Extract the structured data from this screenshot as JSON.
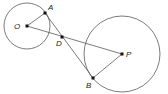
{
  "diagram": {
    "type": "geometry",
    "colors": {
      "stroke": "#5a5a5a",
      "point": "#111111",
      "label": "#222222",
      "background": "#ffffff"
    },
    "circles": [
      {
        "name": "circle-O",
        "center": "O",
        "cx": 27,
        "cy": 26,
        "r": 23
      },
      {
        "name": "circle-P",
        "center": "P",
        "cx": 122,
        "cy": 54,
        "r": 38
      }
    ],
    "points": {
      "O": {
        "label": "O",
        "x": 27,
        "y": 26,
        "lx": 14,
        "ly": 29
      },
      "A": {
        "label": "A",
        "x": 45,
        "y": 13,
        "lx": 48,
        "ly": 10
      },
      "D": {
        "label": "D",
        "x": 62,
        "y": 37,
        "lx": 56,
        "ly": 46
      },
      "P": {
        "label": "P",
        "x": 122,
        "y": 54,
        "lx": 126,
        "ly": 57
      },
      "B": {
        "label": "B",
        "x": 93,
        "y": 78,
        "lx": 86,
        "ly": 88
      }
    },
    "segments": [
      [
        "O",
        "A"
      ],
      [
        "O",
        "P"
      ],
      [
        "A",
        "B"
      ],
      [
        "P",
        "B"
      ]
    ]
  }
}
